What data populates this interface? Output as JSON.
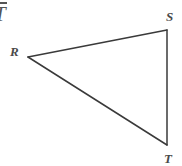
{
  "figure": {
    "kind": "geometry-diagram",
    "shape": "triangle",
    "width": 182,
    "height": 166,
    "background_color": "#ffffff",
    "stroke_color": "#3a3a3a",
    "stroke_width": 1.5,
    "label_color": "#4a4a4a",
    "expression_color": "#555555"
  },
  "annotation": {
    "name": "segment-expression",
    "text": "T",
    "notation": "overline",
    "description": "italic T with overbar (segment notation), clipped at the left edge"
  },
  "vertices": [
    {
      "name": "R",
      "label": "R",
      "x": 28,
      "y": 57,
      "label_x": 10,
      "label_y": 45
    },
    {
      "name": "S",
      "label": "S",
      "x": 167,
      "y": 30,
      "label_x": 166,
      "label_y": 10
    },
    {
      "name": "T",
      "label": "T",
      "x": 167,
      "y": 145,
      "label_x": 164,
      "label_y": 152
    }
  ],
  "edges": [
    {
      "name": "RS",
      "from": "R",
      "to": "S",
      "x1": 28,
      "y1": 57,
      "x2": 167,
      "y2": 30
    },
    {
      "name": "ST",
      "from": "S",
      "to": "T",
      "x1": 167,
      "y1": 30,
      "x2": 167,
      "y2": 145
    },
    {
      "name": "RT",
      "from": "R",
      "to": "T",
      "x1": 28,
      "y1": 57,
      "x2": 167,
      "y2": 145
    }
  ]
}
